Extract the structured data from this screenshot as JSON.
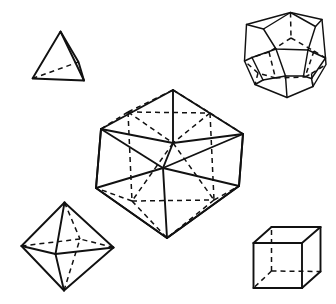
{
  "figure": {
    "background_color": "#ffffff",
    "line_color": "#111111",
    "hidden_line_style": "dashed",
    "width": 336,
    "height": 304,
    "solid_count": 5
  },
  "solids": [
    {
      "id": "tetrahedron",
      "name": "Tetrahedron",
      "faces": 4,
      "vertices": 4,
      "edges": 6,
      "face_shape": "triangle",
      "position": "top-left",
      "bbox": [
        30,
        30,
        58,
        56
      ],
      "points": {
        "apex": [
          60.5,
          31.5
        ],
        "front_left": [
          32.5,
          78.5
        ],
        "front_right": [
          84.0,
          80.5
        ],
        "back_right": [
          78.5,
          62.0
        ]
      },
      "visible_edges": [
        [
          "apex",
          "front_left"
        ],
        [
          "apex",
          "front_right"
        ],
        [
          "apex",
          "back_right"
        ],
        [
          "front_left",
          "front_right"
        ],
        [
          "front_right",
          "back_right"
        ]
      ],
      "hidden_edges": [
        [
          "front_left",
          "back_right"
        ]
      ]
    },
    {
      "id": "dodecahedron",
      "name": "Dodecahedron",
      "faces": 12,
      "vertices": 20,
      "edges": 30,
      "face_shape": "pentagon",
      "position": "top-right",
      "bbox": [
        243,
        11,
        84,
        89
      ],
      "points": {
        "t0": [
          290.5,
          12.5
        ],
        "t1": [
          315.5,
          26.5
        ],
        "t2": [
          308.0,
          50.0
        ],
        "t3": [
          276.0,
          49.0
        ],
        "t4": [
          263.5,
          29.0
        ],
        "u0": [
          322.0,
          19.5
        ],
        "u1": [
          325.5,
          58.0
        ],
        "u2": [
          290.0,
          71.5
        ],
        "u3": [
          252.0,
          57.5
        ],
        "u4": [
          246.5,
          24.5
        ],
        "m0": [
          326.0,
          64.5
        ],
        "m1": [
          313.0,
          86.5
        ],
        "m2": [
          282.0,
          95.5
        ],
        "m3": [
          255.0,
          84.5
        ],
        "m4": [
          244.5,
          61.0
        ],
        "b0": [
          311.5,
          73.5
        ],
        "b1": [
          287.0,
          97.5
        ],
        "b2": [
          258.0,
          73.0
        ],
        "b3": [
          275.5,
          92.0
        ],
        "b4": [
          300.0,
          89.0
        ]
      }
    },
    {
      "id": "icosahedron",
      "name": "Icosahedron",
      "faces": 20,
      "vertices": 12,
      "edges": 30,
      "face_shape": "triangle",
      "position": "center",
      "bbox": [
        94,
        87,
        152,
        153
      ],
      "points": {
        "top": [
          173.0,
          90.0
        ],
        "ul": [
          101.0,
          129.0
        ],
        "ur": [
          243.0,
          134.0
        ],
        "uml": [
          128.0,
          112.0
        ],
        "umr": [
          210.0,
          113.0
        ],
        "center": [
          173.0,
          143.0
        ],
        "ll": [
          96.0,
          188.0
        ],
        "lr": [
          239.0,
          186.0
        ],
        "lml": [
          132.0,
          201.0
        ],
        "lmr": [
          214.0,
          200.0
        ],
        "bot": [
          167.0,
          238.0
        ],
        "back": [
          163.0,
          168.0
        ]
      }
    },
    {
      "id": "octahedron",
      "name": "Octahedron",
      "faces": 8,
      "vertices": 6,
      "edges": 12,
      "face_shape": "triangle",
      "position": "bottom-left",
      "bbox": [
        20,
        200,
        95,
        92
      ],
      "points": {
        "top": [
          64.5,
          202.5
        ],
        "bottom": [
          64.0,
          290.5
        ],
        "left": [
          21.5,
          246.0
        ],
        "right": [
          113.5,
          247.5
        ],
        "front": [
          55.5,
          254.0
        ],
        "back": [
          80.0,
          239.0
        ]
      },
      "visible_edges": [
        [
          "top",
          "left"
        ],
        [
          "top",
          "right"
        ],
        [
          "top",
          "front"
        ],
        [
          "bottom",
          "left"
        ],
        [
          "bottom",
          "right"
        ],
        [
          "bottom",
          "front"
        ],
        [
          "left",
          "front"
        ],
        [
          "right",
          "front"
        ]
      ],
      "hidden_edges": [
        [
          "top",
          "back"
        ],
        [
          "bottom",
          "back"
        ],
        [
          "left",
          "back"
        ],
        [
          "right",
          "back"
        ]
      ]
    },
    {
      "id": "cube",
      "name": "Cube",
      "faces": 6,
      "vertices": 8,
      "edges": 12,
      "face_shape": "square",
      "position": "bottom-right",
      "bbox": [
        252,
        226,
        70,
        63
      ],
      "points": {
        "front_tl": [
          253.5,
          243.0
        ],
        "front_tr": [
          302.0,
          243.0
        ],
        "front_br": [
          302.0,
          288.0
        ],
        "front_bl": [
          253.5,
          288.0
        ],
        "back_tl": [
          271.5,
          227.0
        ],
        "back_tr": [
          320.5,
          227.0
        ],
        "back_br": [
          320.5,
          271.5
        ],
        "back_bl": [
          271.5,
          271.0
        ]
      },
      "visible_edges": [
        [
          "front_tl",
          "front_tr"
        ],
        [
          "front_tr",
          "front_br"
        ],
        [
          "front_br",
          "front_bl"
        ],
        [
          "front_bl",
          "front_tl"
        ],
        [
          "back_tl",
          "back_tr"
        ],
        [
          "back_tr",
          "back_br"
        ],
        [
          "front_tl",
          "back_tl"
        ],
        [
          "front_tr",
          "back_tr"
        ],
        [
          "front_br",
          "back_br"
        ]
      ],
      "hidden_edges": [
        [
          "back_bl",
          "back_tl"
        ],
        [
          "back_bl",
          "back_br"
        ],
        [
          "back_bl",
          "front_bl"
        ]
      ]
    }
  ]
}
